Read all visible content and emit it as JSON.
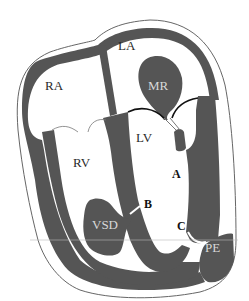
{
  "figure": {
    "colors": {
      "wall": "#555555",
      "outline": "#666666",
      "background": "#ffffff",
      "label_on_light": "#2a2a2a",
      "label_on_dark": "#d8d8d8"
    },
    "labels": {
      "la": "LA",
      "ra": "RA",
      "mr": "MR",
      "lv": "LV",
      "rv": "RV",
      "vsd": "VSD",
      "pe": "PE",
      "a": "A",
      "b": "B",
      "c": "C"
    }
  }
}
